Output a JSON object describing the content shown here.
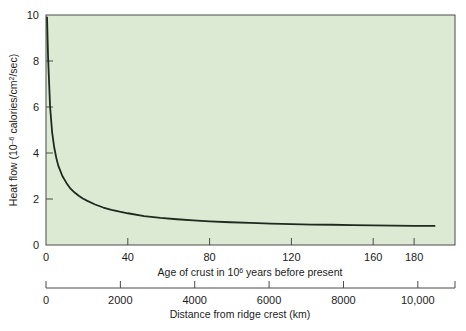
{
  "figure": {
    "name": "heat-flow-vs-age-of-crust",
    "background_color": "#ffffff",
    "plot_background_color": "#dcead4",
    "curve_color": "#1d2a1d",
    "axis_color": "#4a4a4a"
  },
  "chart_data": {
    "type": "line",
    "title": "",
    "subtitle": "",
    "xlabel": "Age of crust in 10⁶ years before present",
    "ylabel": "Heat flow (10⁻⁶ calories/cm²/sec)",
    "secondary_xlabel": "Distance from ridge crest (km)",
    "xlim": [
      0,
      200
    ],
    "ylim": [
      0,
      10
    ],
    "secondary_xlim": [
      0,
      11000
    ],
    "grid": false,
    "legend": null,
    "xticks": [
      0,
      40,
      80,
      120,
      160,
      180
    ],
    "xtick_labels": [
      "0",
      "40",
      "80",
      "120",
      "160",
      "180"
    ],
    "yticks": [
      0,
      2,
      4,
      6,
      8,
      10
    ],
    "ytick_labels": [
      "0",
      "2",
      "4",
      "6",
      "8",
      "10"
    ],
    "secondary_xticks": [
      0,
      2000,
      4000,
      6000,
      8000,
      10000
    ],
    "secondary_xtick_labels": [
      "0",
      "2000",
      "4000",
      "6000",
      "8000",
      "10,000"
    ],
    "series": [
      {
        "name": "Heat flow",
        "x": [
          0.5,
          1,
          2,
          3,
          4,
          5,
          6,
          8,
          10,
          12,
          14,
          16,
          18,
          20,
          24,
          28,
          32,
          36,
          40,
          48,
          56,
          64,
          72,
          80,
          90,
          100,
          110,
          120,
          130,
          140,
          150,
          160,
          170,
          180,
          190
        ],
        "values": [
          9.9,
          8.2,
          6.0,
          4.9,
          4.25,
          3.8,
          3.45,
          3.0,
          2.7,
          2.45,
          2.28,
          2.14,
          2.02,
          1.93,
          1.76,
          1.63,
          1.53,
          1.45,
          1.38,
          1.26,
          1.18,
          1.12,
          1.07,
          1.03,
          0.99,
          0.96,
          0.93,
          0.91,
          0.89,
          0.88,
          0.86,
          0.85,
          0.84,
          0.83,
          0.83
        ]
      }
    ],
    "superscript_notes": {
      "ylabel_base": "Heat flow (10",
      "ylabel_exp1": "–6",
      "ylabel_mid": " calories/cm",
      "ylabel_exp2": "2",
      "ylabel_tail": "/sec)",
      "xlabel_base": "Age of crust in 10",
      "xlabel_exp": "6",
      "xlabel_tail": " years before present"
    }
  }
}
